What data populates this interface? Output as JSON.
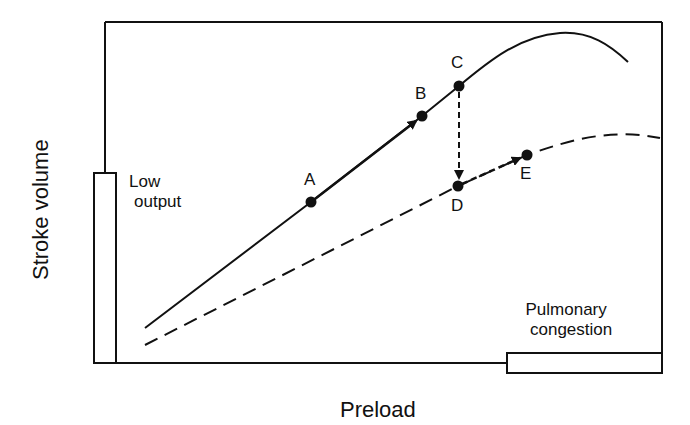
{
  "diagram": {
    "title": "",
    "x_axis_label": "Preload",
    "y_axis_label": "Stroke volume",
    "regions": {
      "low_output": {
        "line1": "Low",
        "line2": "output"
      },
      "pulmonary_congestion": {
        "line1": "Pulmonary",
        "line2": "congestion"
      }
    },
    "points": [
      {
        "id": "A",
        "label": "A",
        "curve": "normal"
      },
      {
        "id": "B",
        "label": "B",
        "curve": "normal"
      },
      {
        "id": "C",
        "label": "C",
        "curve": "normal"
      },
      {
        "id": "D",
        "label": "D",
        "curve": "depressed"
      },
      {
        "id": "E",
        "label": "E",
        "curve": "depressed"
      }
    ],
    "curves": [
      {
        "name": "normal",
        "style": "solid"
      },
      {
        "name": "depressed",
        "style": "dashed"
      }
    ],
    "transitions": [
      {
        "from": "A",
        "to": "B",
        "style": "solid-arrow"
      },
      {
        "from": "C",
        "to": "D",
        "style": "dashed-arrow"
      },
      {
        "from": "D",
        "to": "E",
        "style": "dashed-arrow"
      }
    ],
    "colors": {
      "ink": "#111111",
      "background": "#ffffff"
    }
  }
}
